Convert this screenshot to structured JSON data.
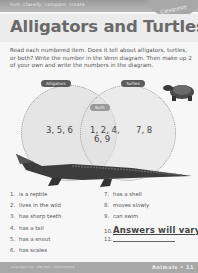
{
  "header": {
    "banner_text": "Sort, classify, compare, create",
    "category_tab": "Categorize",
    "title": "Alligators and Turtles"
  },
  "instructions": "Read each numbered item. Does it tell about alligators, turtles, or both? Write the number in the Venn diagram. Then make up 2 of your own and write the numbers in the diagram.",
  "venn": {
    "left_label": "Alligators",
    "right_label": "Turtles",
    "center_label": "Both",
    "left_values": "3, 5, 6",
    "center_values_line1": "1, 2, 4,",
    "center_values_line2": "6, 9",
    "right_values": "7, 8"
  },
  "items": {
    "left": [
      {
        "num": "1.",
        "text": "is a reptile"
      },
      {
        "num": "2.",
        "text": "lives in the wild"
      },
      {
        "num": "3.",
        "text": "has sharp teeth"
      },
      {
        "num": "4.",
        "text": "has a tail"
      },
      {
        "num": "5.",
        "text": "has a snout"
      },
      {
        "num": "6.",
        "text": "has scales"
      }
    ],
    "right": [
      {
        "num": "7.",
        "text": "has a shell"
      },
      {
        "num": "8.",
        "text": "moves slowly"
      },
      {
        "num": "9.",
        "text": "can swim"
      },
      {
        "num": "10.",
        "text": "Answers will vary."
      },
      {
        "num": "11.",
        "text": ""
      }
    ]
  },
  "footer": {
    "copyright": "©Evan-Moor Corp. • EMC 5021 • Critical Thinking",
    "section": "Animals",
    "page": "11"
  }
}
